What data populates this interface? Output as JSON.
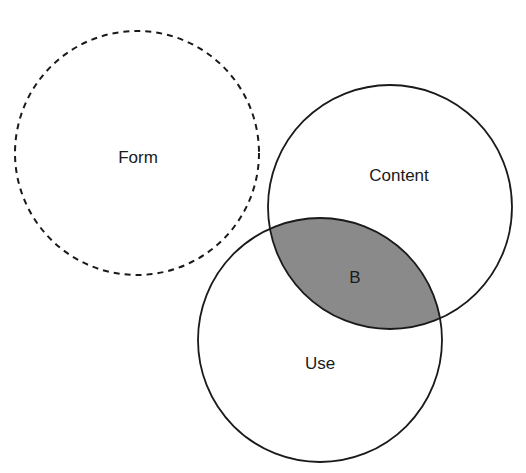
{
  "diagram": {
    "type": "venn",
    "colors": {
      "stroke": "#1a1a1a",
      "intersection_fill": "#8a8a8a",
      "background": "#ffffff"
    },
    "circles": [
      {
        "id": "form",
        "label": "Form",
        "cx": 137,
        "cy": 153,
        "r": 122,
        "style": "dashed"
      },
      {
        "id": "content",
        "label": "Content",
        "cx": 390,
        "cy": 207,
        "r": 122,
        "style": "solid"
      },
      {
        "id": "use",
        "label": "Use",
        "cx": 320,
        "cy": 340,
        "r": 122,
        "style": "solid"
      }
    ],
    "intersection": {
      "label": "B",
      "between": [
        "content",
        "use"
      ]
    }
  }
}
